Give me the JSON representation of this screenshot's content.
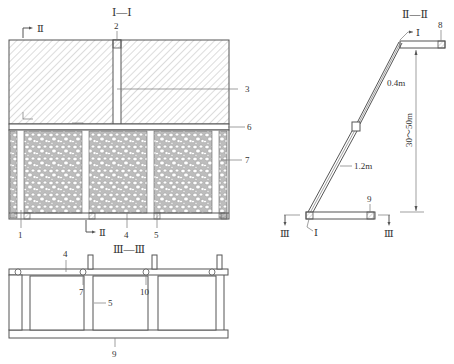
{
  "diagram": {
    "type": "engineering-section-drawing",
    "colors": {
      "line": "#555555",
      "hatch": "#9a9a9a",
      "text": "#333333",
      "background": "#ffffff"
    }
  },
  "section_I": {
    "title": "Ⅰ—Ⅰ",
    "cut_marker_top": "Ⅱ",
    "cut_marker_bottom": "Ⅱ",
    "callouts": {
      "c1": "1",
      "c2": "2",
      "c3": "3",
      "c4": "4",
      "c5": "5",
      "c6": "6",
      "c7": "7"
    }
  },
  "section_II": {
    "title": "Ⅱ—Ⅱ",
    "cut_marker_top": "Ⅰ",
    "cut_marker_bottom": "Ⅰ",
    "cut_marker_left": "Ⅲ",
    "cut_marker_right": "Ⅲ",
    "dim_upper": "0.4m",
    "dim_lower": "1.2m",
    "dim_height": "30～50m",
    "callouts": {
      "c8": "8",
      "c9": "9"
    }
  },
  "section_III": {
    "title": "Ⅲ—Ⅲ",
    "callouts": {
      "c4": "4",
      "c5": "5",
      "c7": "7",
      "c9": "9",
      "c10": "10"
    }
  }
}
